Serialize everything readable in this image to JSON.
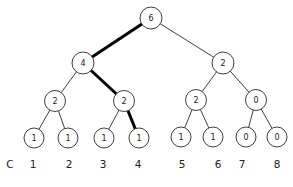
{
  "diagram": {
    "type": "binary-tree",
    "colors": {
      "background": "#ffffff",
      "node_fill": "#ffffff",
      "node_stroke": "#3f3f3f",
      "edge": "#2a2a2a",
      "bold_edge": "#000000",
      "text": "#222222"
    },
    "nodes": [
      {
        "id": "n6",
        "value": "6",
        "x": 151,
        "y": 18,
        "r": 11
      },
      {
        "id": "n4",
        "value": "4",
        "x": 83,
        "y": 63,
        "r": 11
      },
      {
        "id": "n2R",
        "value": "2",
        "x": 223,
        "y": 63,
        "r": 11
      },
      {
        "id": "n2a",
        "value": "2",
        "x": 55,
        "y": 101,
        "r": 10.5
      },
      {
        "id": "n2b",
        "value": "2",
        "x": 124,
        "y": 101,
        "r": 10.5
      },
      {
        "id": "n2c",
        "value": "2",
        "x": 196,
        "y": 100,
        "r": 10.5
      },
      {
        "id": "n0",
        "value": "0",
        "x": 256,
        "y": 100,
        "r": 10.5
      },
      {
        "id": "l1",
        "value": "1",
        "x": 34,
        "y": 138,
        "r": 10
      },
      {
        "id": "l2",
        "value": "1",
        "x": 68,
        "y": 138,
        "r": 10
      },
      {
        "id": "l3",
        "value": "1",
        "x": 104,
        "y": 138,
        "r": 10
      },
      {
        "id": "l4",
        "value": "1",
        "x": 139,
        "y": 138,
        "r": 10
      },
      {
        "id": "l5",
        "value": "1",
        "x": 181,
        "y": 137,
        "r": 10
      },
      {
        "id": "l6",
        "value": "1",
        "x": 213,
        "y": 137,
        "r": 10
      },
      {
        "id": "l7",
        "value": "0",
        "x": 246,
        "y": 137,
        "r": 10
      },
      {
        "id": "l8",
        "value": "0",
        "x": 277,
        "y": 137,
        "r": 10
      }
    ],
    "edges": [
      {
        "from": "n6",
        "to": "n4",
        "bold": true
      },
      {
        "from": "n6",
        "to": "n2R",
        "bold": false
      },
      {
        "from": "n4",
        "to": "n2a",
        "bold": false
      },
      {
        "from": "n4",
        "to": "n2b",
        "bold": true
      },
      {
        "from": "n2R",
        "to": "n2c",
        "bold": false
      },
      {
        "from": "n2R",
        "to": "n0",
        "bold": false
      },
      {
        "from": "n2a",
        "to": "l1",
        "bold": false
      },
      {
        "from": "n2a",
        "to": "l2",
        "bold": false
      },
      {
        "from": "n2b",
        "to": "l3",
        "bold": false
      },
      {
        "from": "n2b",
        "to": "l4",
        "bold": true
      },
      {
        "from": "n2c",
        "to": "l5",
        "bold": false
      },
      {
        "from": "n2c",
        "to": "l6",
        "bold": false
      },
      {
        "from": "n0",
        "to": "l7",
        "bold": false
      },
      {
        "from": "n0",
        "to": "l8",
        "bold": false
      }
    ],
    "column_labels": [
      {
        "text": "C",
        "x": 10,
        "y": 164
      },
      {
        "text": "1",
        "x": 33,
        "y": 164
      },
      {
        "text": "2",
        "x": 69,
        "y": 164
      },
      {
        "text": "3",
        "x": 103,
        "y": 164
      },
      {
        "text": "4",
        "x": 138,
        "y": 164
      },
      {
        "text": "5",
        "x": 182,
        "y": 164
      },
      {
        "text": "6",
        "x": 218,
        "y": 164
      },
      {
        "text": "7",
        "x": 242,
        "y": 164
      },
      {
        "text": "8",
        "x": 277,
        "y": 164
      }
    ]
  }
}
